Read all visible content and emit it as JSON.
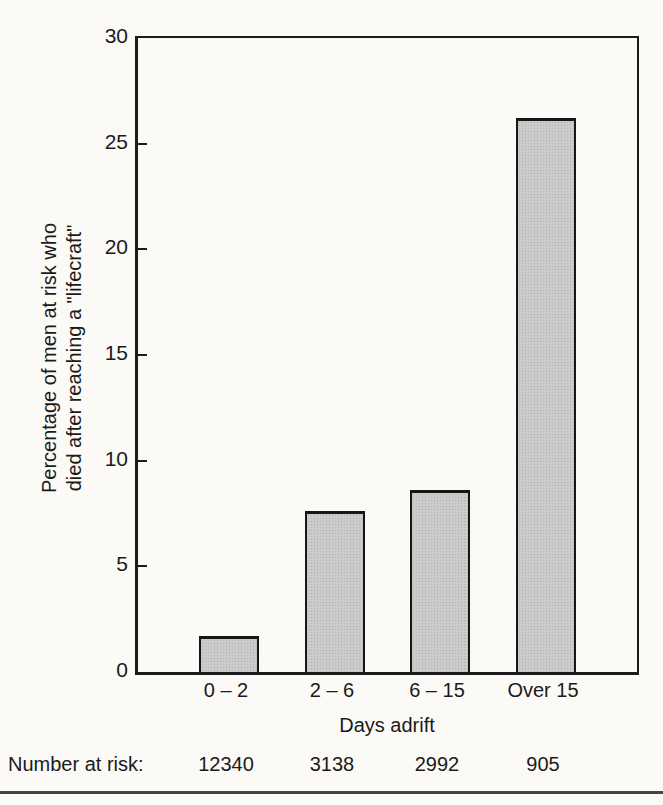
{
  "figure": {
    "paper_color": "#fbfaf7",
    "line_color": "#1c1c1c",
    "bar_fill_color": "#cbcbcb",
    "bar_border_color": "#161616",
    "bottom_rule_color": "#454545"
  },
  "chart_data": {
    "type": "bar",
    "title": "",
    "categories": [
      "0 – 2",
      "2 – 6",
      "6 – 15",
      "Over 15"
    ],
    "values": [
      1.7,
      7.6,
      8.6,
      26.2
    ],
    "xlabel": "Days adrift",
    "ylabel": "Percentage of men at risk who died after reaching a \"lifecraft\"",
    "ylabel_lines": [
      "Percentage of men at risk who",
      "died after reaching a \"lifecraft\""
    ],
    "ylim": [
      0,
      30
    ],
    "yticks": [
      0,
      5,
      10,
      15,
      20,
      25,
      30
    ],
    "grid": false,
    "legend": null,
    "annotations": {
      "number_at_risk": {
        "label": "Number at risk:",
        "values": [
          "12340",
          "3138",
          "2992",
          "905"
        ]
      }
    }
  }
}
